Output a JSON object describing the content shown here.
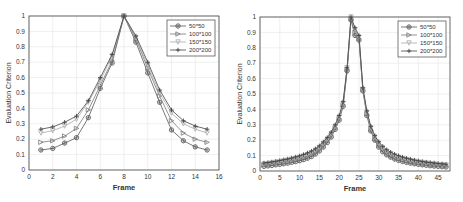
{
  "chart_data": [
    {
      "type": "line",
      "title": "",
      "xlabel": "Frame",
      "ylabel": "Evaluation Criterion",
      "xlim": [
        0,
        16
      ],
      "ylim": [
        0,
        1
      ],
      "xticks": [
        0,
        2,
        4,
        6,
        8,
        10,
        12,
        14,
        16
      ],
      "yticks": [
        0,
        0.1,
        0.2,
        0.3,
        0.4,
        0.5,
        0.6,
        0.7,
        0.8,
        0.9,
        1
      ],
      "grid": true,
      "legend_position": "upper right",
      "x": [
        1,
        2,
        3,
        4,
        5,
        6,
        7,
        8,
        9,
        10,
        11,
        12,
        13,
        14,
        15
      ],
      "series": [
        {
          "name": "50*50",
          "marker": "asterisk-circle",
          "color": "#555555",
          "values": [
            0.13,
            0.14,
            0.175,
            0.21,
            0.34,
            0.53,
            0.695,
            1.0,
            0.83,
            0.63,
            0.44,
            0.26,
            0.19,
            0.15,
            0.13
          ]
        },
        {
          "name": "100*100",
          "marker": "triangle-right",
          "color": "#777777",
          "values": [
            0.18,
            0.19,
            0.22,
            0.27,
            0.39,
            0.55,
            0.71,
            1.0,
            0.85,
            0.66,
            0.48,
            0.32,
            0.24,
            0.2,
            0.18
          ]
        },
        {
          "name": "150*150",
          "marker": "triangle-down",
          "color": "#aaaaaa",
          "values": [
            0.24,
            0.255,
            0.285,
            0.33,
            0.44,
            0.58,
            0.74,
            1.0,
            0.86,
            0.68,
            0.5,
            0.37,
            0.3,
            0.265,
            0.24
          ]
        },
        {
          "name": "200*200",
          "marker": "plus",
          "color": "#444444",
          "values": [
            0.265,
            0.28,
            0.31,
            0.35,
            0.45,
            0.6,
            0.75,
            1.0,
            0.87,
            0.7,
            0.52,
            0.39,
            0.32,
            0.285,
            0.265
          ]
        }
      ]
    },
    {
      "type": "line",
      "title": "",
      "xlabel": "Frame",
      "ylabel": "Evaluation Criterion",
      "xlim": [
        0,
        48
      ],
      "ylim": [
        0,
        1
      ],
      "xticks": [
        0,
        5,
        10,
        15,
        20,
        25,
        30,
        35,
        40,
        45
      ],
      "yticks": [
        0,
        0.1,
        0.2,
        0.3,
        0.4,
        0.5,
        0.6,
        0.7,
        0.8,
        0.9,
        1
      ],
      "grid": true,
      "legend_position": "upper right",
      "x": [
        1,
        2,
        3,
        4,
        5,
        6,
        7,
        8,
        9,
        10,
        11,
        12,
        13,
        14,
        15,
        16,
        17,
        18,
        19,
        20,
        21,
        22,
        23,
        24,
        25,
        26,
        27,
        28,
        29,
        30,
        31,
        32,
        33,
        34,
        35,
        36,
        37,
        38,
        39,
        40,
        41,
        42,
        43,
        44,
        45,
        46,
        47
      ],
      "series": [
        {
          "name": "50*50",
          "marker": "asterisk-circle",
          "color": "#555555",
          "values": [
            0.03,
            0.033,
            0.036,
            0.04,
            0.043,
            0.047,
            0.051,
            0.056,
            0.061,
            0.067,
            0.074,
            0.083,
            0.094,
            0.11,
            0.13,
            0.155,
            0.185,
            0.22,
            0.27,
            0.33,
            0.42,
            0.65,
            0.98,
            0.88,
            0.85,
            0.52,
            0.36,
            0.26,
            0.2,
            0.155,
            0.125,
            0.105,
            0.09,
            0.078,
            0.069,
            0.062,
            0.056,
            0.051,
            0.047,
            0.043,
            0.04,
            0.037,
            0.034,
            0.032,
            0.03,
            0.028,
            0.026
          ]
        },
        {
          "name": "100*100",
          "marker": "triangle-right",
          "color": "#777777",
          "values": [
            0.038,
            0.041,
            0.044,
            0.048,
            0.052,
            0.056,
            0.061,
            0.066,
            0.072,
            0.079,
            0.087,
            0.097,
            0.108,
            0.124,
            0.143,
            0.168,
            0.197,
            0.232,
            0.28,
            0.34,
            0.43,
            0.66,
            0.99,
            0.9,
            0.86,
            0.53,
            0.37,
            0.27,
            0.21,
            0.168,
            0.138,
            0.117,
            0.101,
            0.089,
            0.079,
            0.071,
            0.065,
            0.059,
            0.055,
            0.051,
            0.047,
            0.044,
            0.041,
            0.039,
            0.036,
            0.034,
            0.032
          ]
        },
        {
          "name": "150*150",
          "marker": "triangle-down",
          "color": "#aaaaaa",
          "values": [
            0.045,
            0.048,
            0.052,
            0.056,
            0.06,
            0.065,
            0.07,
            0.076,
            0.082,
            0.089,
            0.097,
            0.107,
            0.119,
            0.134,
            0.153,
            0.178,
            0.207,
            0.242,
            0.29,
            0.35,
            0.44,
            0.67,
            1.0,
            0.92,
            0.87,
            0.53,
            0.38,
            0.28,
            0.22,
            0.18,
            0.15,
            0.128,
            0.112,
            0.099,
            0.089,
            0.081,
            0.074,
            0.068,
            0.063,
            0.058,
            0.054,
            0.051,
            0.048,
            0.045,
            0.042,
            0.04,
            0.038
          ]
        },
        {
          "name": "200*200",
          "marker": "plus",
          "color": "#444444",
          "values": [
            0.052,
            0.055,
            0.059,
            0.063,
            0.068,
            0.073,
            0.078,
            0.084,
            0.091,
            0.098,
            0.107,
            0.117,
            0.129,
            0.144,
            0.163,
            0.188,
            0.217,
            0.252,
            0.3,
            0.36,
            0.45,
            0.67,
            1.0,
            0.93,
            0.88,
            0.54,
            0.39,
            0.29,
            0.23,
            0.19,
            0.16,
            0.138,
            0.122,
            0.109,
            0.099,
            0.09,
            0.083,
            0.077,
            0.071,
            0.066,
            0.062,
            0.058,
            0.055,
            0.052,
            0.049,
            0.047,
            0.044
          ]
        }
      ]
    }
  ],
  "charts": [
    {
      "xlabel": "Frame",
      "ylabel": "Evaluation Criterion"
    },
    {
      "xlabel": "Frame",
      "ylabel": "Evaluation Criterion"
    }
  ]
}
